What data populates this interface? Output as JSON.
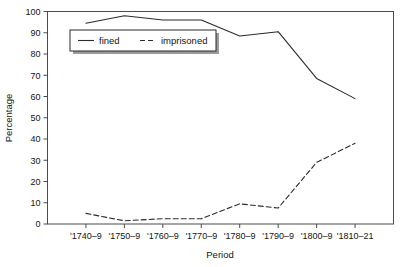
{
  "chart_data": {
    "type": "line",
    "title": "",
    "xlabel": "Period",
    "ylabel": "Percentage",
    "categories": [
      "'1740–9",
      "'1750–9",
      "'1760–9",
      "'1770–9",
      "'1780–9",
      "'1790–9",
      "'1800–9",
      "'1810–21"
    ],
    "ylim": [
      0,
      100
    ],
    "ytick_labels": [
      "0",
      "10",
      "20",
      "30",
      "40",
      "50",
      "60",
      "70",
      "80",
      "90",
      "100"
    ],
    "ytick_values": [
      0,
      10,
      20,
      30,
      40,
      50,
      60,
      70,
      80,
      90,
      100
    ],
    "grid": false,
    "legend_position": "upper-left-inside",
    "series": [
      {
        "name": "fined",
        "style": "solid",
        "color": "#2b2b2b",
        "values": [
          94.5,
          98,
          96,
          96,
          88.5,
          90.5,
          68.5,
          59
        ]
      },
      {
        "name": "imprisoned",
        "style": "dashed",
        "color": "#2b2b2b",
        "values": [
          5,
          1.5,
          2.5,
          2.5,
          9.5,
          7.5,
          29,
          38
        ]
      }
    ]
  },
  "axis": {
    "y_title": "Percentage",
    "x_title": "Period"
  },
  "legend": {
    "entries": [
      {
        "label": "fined",
        "dash": "solid"
      },
      {
        "label": "imprisoned",
        "dash": "dashed"
      }
    ]
  }
}
